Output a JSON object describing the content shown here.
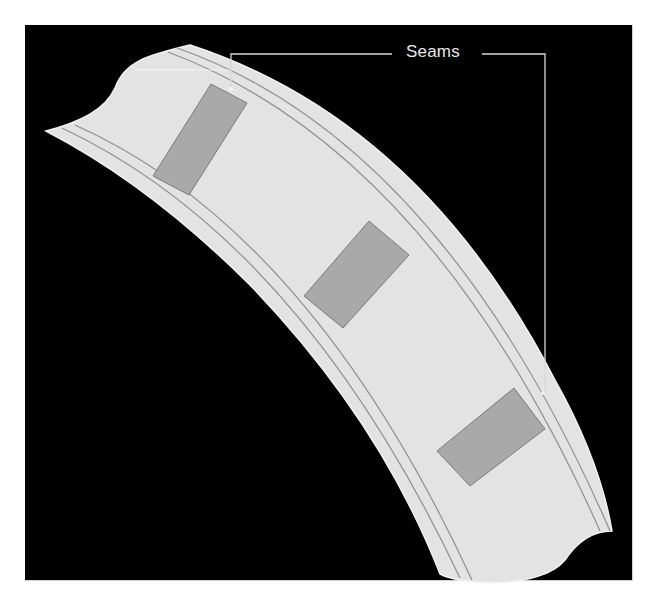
{
  "figure": {
    "callout_label": "Seams",
    "colors": {
      "background": "#000000",
      "band_fill": "#e3e3e3",
      "band_edge": "#eeeeee",
      "stitch_line": "#8e8e8e",
      "seam_panel_fill": "#a9a9a9",
      "seam_panel_stroke": "#7a7a7a",
      "callout_line": "#d8d8d8"
    },
    "seam_panels": [
      {
        "name": "seam-panel-1",
        "points": "211,84 247,103 189,195 153,176"
      },
      {
        "name": "seam-panel-2",
        "points": "369,221 409,255 343,328 304,296"
      },
      {
        "name": "seam-panel-3",
        "points": "514,388 545,429 470,486 437,451"
      }
    ],
    "callout_targets": [
      {
        "name": "seam-marker-1",
        "x": 231,
        "y": 89
      },
      {
        "name": "seam-marker-2",
        "x": 543,
        "y": 393
      }
    ]
  }
}
